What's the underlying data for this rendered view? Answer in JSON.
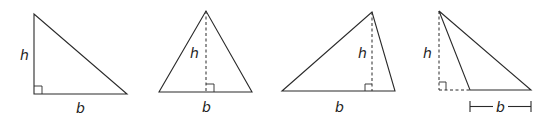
{
  "triangles": [
    {
      "name": "right-triangle",
      "height_label": "h",
      "base_label": "b"
    },
    {
      "name": "isosceles-triangle",
      "height_label": "h",
      "base_label": "b"
    },
    {
      "name": "scalene-triangle",
      "height_label": "h",
      "base_label": "b"
    },
    {
      "name": "obtuse-triangle",
      "height_label": "h",
      "base_label": "b"
    }
  ]
}
